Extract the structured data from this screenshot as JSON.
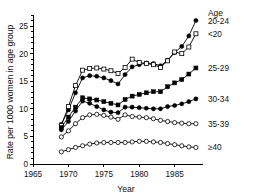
{
  "chart_data": {
    "type": "line",
    "title": "",
    "xlabel": "Year",
    "ylabel": "Rate per 1000 women in age group",
    "xlim": [
      1965,
      1989
    ],
    "ylim": [
      0,
      27
    ],
    "xticks": [
      1965,
      1970,
      1975,
      1980,
      1985
    ],
    "yticks": [
      0,
      5,
      10,
      15,
      20,
      25
    ],
    "grid": false,
    "legend_position": "right",
    "legend_title": "Age",
    "x": [
      1969,
      1970,
      1971,
      1972,
      1973,
      1974,
      1975,
      1976,
      1977,
      1978,
      1979,
      1980,
      1981,
      1982,
      1983,
      1984,
      1985,
      1986,
      1987,
      1988
    ],
    "series": [
      {
        "name": "20-24",
        "label": "20-24",
        "marker": "filled-circle",
        "values": [
          7.2,
          9.8,
          12.9,
          15.6,
          16.0,
          15.9,
          15.6,
          15.1,
          14.5,
          16.2,
          17.6,
          18.0,
          18.3,
          18.2,
          17.8,
          18.8,
          20.2,
          21.3,
          23.2,
          26.0
        ]
      },
      {
        "name": "<20",
        "label": "<20",
        "marker": "open-square",
        "values": [
          7.0,
          10.4,
          14.2,
          17.0,
          17.3,
          17.4,
          17.2,
          16.9,
          16.4,
          17.5,
          19.0,
          18.4,
          18.2,
          18.0,
          17.5,
          18.7,
          20.3,
          20.0,
          21.2,
          23.6
        ]
      },
      {
        "name": "25-29",
        "label": "25-29",
        "marker": "filled-square",
        "values": [
          6.6,
          8.5,
          10.3,
          12.0,
          11.8,
          11.6,
          11.3,
          11.0,
          10.7,
          11.7,
          12.3,
          12.6,
          12.9,
          13.1,
          13.1,
          14.0,
          14.7,
          15.3,
          16.3,
          17.4
        ]
      },
      {
        "name": "30-34",
        "label": "30-34",
        "marker": "filled-circle",
        "values": [
          6.2,
          7.7,
          9.6,
          11.4,
          11.0,
          10.4,
          9.8,
          9.4,
          9.3,
          10.3,
          10.3,
          10.2,
          10.1,
          10.0,
          10.0,
          10.4,
          10.6,
          10.9,
          11.3,
          11.8
        ]
      },
      {
        "name": "35-39",
        "label": "35-39",
        "marker": "open-circle",
        "values": [
          4.9,
          6.0,
          7.3,
          8.4,
          8.9,
          9.0,
          8.8,
          8.5,
          8.1,
          8.9,
          8.6,
          8.5,
          8.4,
          8.2,
          7.9,
          7.7,
          7.5,
          7.4,
          7.3,
          7.3
        ]
      },
      {
        "name": "≥40",
        "label": "≥40",
        "marker": "open-circle",
        "values": [
          2.2,
          2.6,
          3.0,
          3.3,
          3.6,
          3.8,
          3.9,
          3.9,
          3.9,
          3.9,
          4.0,
          4.1,
          4.1,
          4.0,
          3.9,
          3.7,
          3.5,
          3.3,
          3.1,
          3.0
        ]
      }
    ]
  },
  "axes": {
    "x_title": "Year",
    "y_title": "Rate per 1000 women in age group"
  },
  "legend": {
    "title": "Age",
    "entries": [
      {
        "label": "20-24"
      },
      {
        "label": "<20"
      },
      {
        "label": "25-29"
      },
      {
        "label": "30-34"
      },
      {
        "label": "35-39"
      },
      {
        "label": "≥40"
      }
    ]
  },
  "colors": {
    "axis": "#000000",
    "series": "#000000",
    "background": "#ffffff"
  }
}
